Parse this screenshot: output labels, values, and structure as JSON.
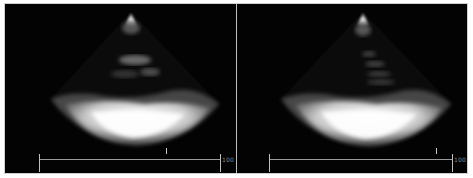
{
  "figure": {
    "type": "echocardiogram-pair",
    "panels": [
      {
        "id": "left",
        "description": "Ultrasound sector image, parasternal-like view",
        "scale_label": "100",
        "scale_color": "#9a9a9a"
      },
      {
        "id": "right",
        "description": "Ultrasound sector image, parasternal-like view",
        "scale_label": "100",
        "scale_color": "#9a9a9a"
      }
    ]
  },
  "colors": {
    "background": "#000000",
    "page": "#ffffff",
    "divider": "#bdbdbd"
  }
}
